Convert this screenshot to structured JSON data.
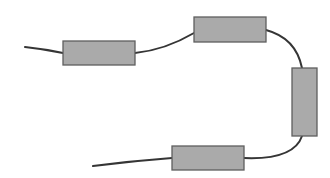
{
  "diagram": {
    "type": "chain",
    "colors": {
      "background": "#ffffff",
      "segment_fill": "#aaaaaa",
      "segment_stroke": "#5f5f5f",
      "wire": "#353535"
    },
    "segments": [
      {
        "id": "segment-1",
        "x": 63,
        "y": 41,
        "width": 72,
        "height": 24,
        "orientation": "horizontal"
      },
      {
        "id": "segment-2",
        "x": 194,
        "y": 17,
        "width": 72,
        "height": 25,
        "orientation": "horizontal"
      },
      {
        "id": "segment-3",
        "x": 292,
        "y": 68,
        "width": 25,
        "height": 68,
        "orientation": "vertical"
      },
      {
        "id": "segment-4",
        "x": 172,
        "y": 146,
        "width": 72,
        "height": 24,
        "orientation": "horizontal"
      }
    ],
    "wires": [
      {
        "id": "wire-lead-in",
        "d": "M 25 47 Q 44 49 63 53"
      },
      {
        "id": "wire-1-2",
        "d": "M 135 53 Q 165 50 194 33"
      },
      {
        "id": "wire-2-3",
        "d": "M 266 30 Q 296 38 302 68"
      },
      {
        "id": "wire-3-4",
        "d": "M 302 136 Q 294 160 244 158"
      },
      {
        "id": "wire-lead-out",
        "d": "M 93 166 Q 132 161 172 158"
      }
    ]
  }
}
